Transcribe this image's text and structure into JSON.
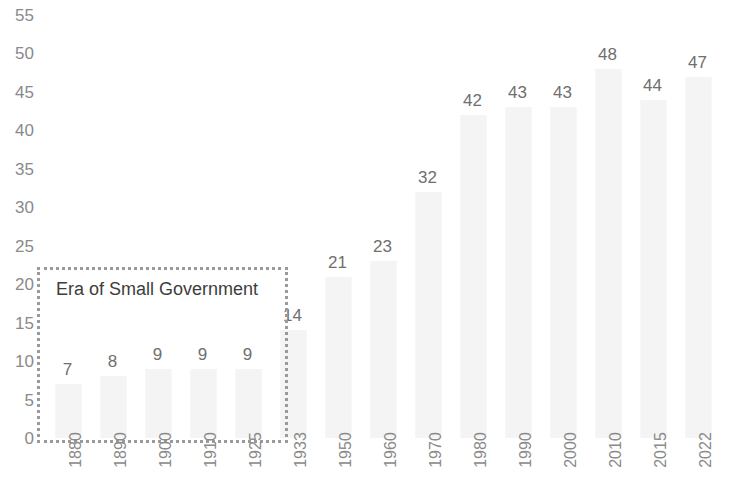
{
  "chart_data": {
    "type": "bar",
    "title": "",
    "subtitle": "",
    "xlabel": "",
    "ylabel": "",
    "categories": [
      "1880",
      "1890",
      "1900",
      "1910",
      "1925",
      "1933",
      "1950",
      "1960",
      "1970",
      "1980",
      "1990",
      "2000",
      "2010",
      "2015",
      "2022"
    ],
    "values": [
      7,
      8,
      9,
      9,
      9,
      14,
      21,
      23,
      32,
      42,
      43,
      43,
      48,
      44,
      47
    ],
    "data_labels": [
      "7",
      "8",
      "9",
      "9",
      "9",
      "14",
      "21",
      "23",
      "32",
      "42",
      "43",
      "43",
      "48",
      "44",
      "47"
    ],
    "ylim": [
      0,
      55
    ],
    "y_ticks": [
      "0",
      "5",
      "10",
      "15",
      "20",
      "25",
      "30",
      "35",
      "40",
      "45",
      "50",
      "55"
    ],
    "y_tick_values": [
      0,
      5,
      10,
      15,
      20,
      25,
      30,
      35,
      40,
      45,
      50,
      55
    ],
    "grid": false,
    "legend": false,
    "legend_position": "none",
    "annotations": [
      {
        "text": "Era of Small Government",
        "type": "dotted-box",
        "covers_categories": [
          "1880",
          "1890",
          "1900",
          "1910",
          "1925"
        ]
      }
    ],
    "colors": {
      "bar_fill": "#f4f4f4",
      "axis_text": "#8a8a8a",
      "data_label_text": "#6f6f6f",
      "annotation_border": "#9a9a9a",
      "annotation_text": "#3d3d3d",
      "background": "#ffffff"
    }
  }
}
